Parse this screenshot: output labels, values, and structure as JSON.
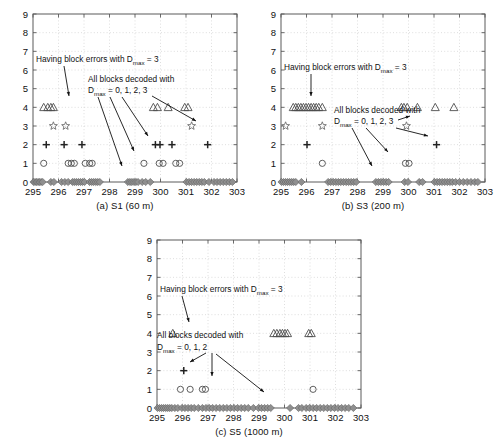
{
  "figure": {
    "axis": {
      "xticks": [
        "295",
        "296",
        "297",
        "298",
        "299",
        "300",
        "301",
        "302",
        "303"
      ],
      "yticks": [
        "0",
        "1",
        "2",
        "3",
        "4",
        "5",
        "6",
        "7",
        "8",
        "9"
      ],
      "xlim": [
        295,
        303
      ],
      "ylim": [
        0,
        9
      ],
      "grid": true
    },
    "annotations": {
      "errors_line": "Having block errors with D",
      "errors_sub": "max",
      "errors_tail": " = 3",
      "decoded_line1": "All blocks decoded with",
      "decoded_line2_pre": "D",
      "decoded_line2_sub": "max",
      "decoded_line2_a": " = 0, 1, 2, 3",
      "decoded_line2_c": " = 0, 1, 2"
    },
    "panels": [
      {
        "id": "a",
        "caption": "(a) S1 (60 m)"
      },
      {
        "id": "b",
        "caption": "(b) S3 (200 m)"
      },
      {
        "id": "c",
        "caption": "(c) S5 (1000 m)"
      }
    ]
  },
  "chart_data": [
    {
      "type": "scatter",
      "title": "(a) S1 (60 m)",
      "xlabel": "",
      "ylabel": "",
      "xlim": [
        295,
        303
      ],
      "ylim": [
        0,
        9
      ],
      "grid": true,
      "legend": "none",
      "series": [
        {
          "name": "Dmax = 3 (triangle)",
          "marker": "triangle",
          "y": 4,
          "x": [
            295.42,
            295.58,
            295.7,
            295.8,
            299.72,
            299.88,
            300.3,
            300.95,
            301.08
          ]
        },
        {
          "name": "Dmax = 3 errors (star)",
          "marker": "star",
          "y": 3,
          "x": [
            295.8,
            296.28,
            301.22
          ]
        },
        {
          "name": "Dmax = 2 (plus)",
          "marker": "plus",
          "y": 2,
          "x": [
            295.52,
            296.22,
            296.92,
            299.8,
            299.98,
            300.45,
            301.85
          ]
        },
        {
          "name": "Dmax = 1 (circle)",
          "marker": "circle",
          "y": 1,
          "x": [
            295.42,
            296.38,
            296.5,
            296.62,
            297.05,
            297.22,
            297.32,
            299.35,
            299.95,
            300.1,
            300.6,
            300.75
          ]
        },
        {
          "name": "Dmax = 0 (diamond)",
          "marker": "diamond",
          "y": 0,
          "x": [
            295.02,
            295.08,
            295.14,
            295.2,
            295.26,
            295.32,
            295.38,
            295.7,
            295.82,
            296.12,
            296.25,
            296.38,
            296.55,
            296.62,
            296.7,
            296.78,
            296.86,
            296.94,
            297.02,
            297.22,
            297.3,
            297.38,
            297.46,
            297.54,
            297.62,
            298.72,
            298.8,
            298.88,
            298.96,
            299.04,
            299.12,
            299.28,
            299.42,
            299.6,
            301.02,
            301.12,
            301.22,
            301.32,
            301.42,
            301.52,
            301.62,
            301.72,
            301.9,
            302.1,
            302.22,
            302.34,
            302.46,
            302.58,
            302.7,
            302.82
          ]
        }
      ]
    },
    {
      "type": "scatter",
      "title": "(b) S3 (200 m)",
      "xlabel": "",
      "ylabel": "",
      "xlim": [
        295,
        303
      ],
      "ylim": [
        0,
        9
      ],
      "grid": true,
      "legend": "none",
      "series": [
        {
          "name": "Dmax = 3 (triangle)",
          "marker": "triangle",
          "y": 4,
          "x": [
            295.48,
            295.58,
            295.68,
            295.78,
            295.88,
            295.98,
            296.08,
            296.18,
            296.28,
            296.38,
            296.48,
            296.62,
            299.72,
            299.82,
            299.95,
            300.35,
            301.05,
            301.78
          ]
        },
        {
          "name": "Dmax = 3 errors (star)",
          "marker": "star",
          "y": 3,
          "x": [
            295.18,
            296.62,
            299.92
          ]
        },
        {
          "name": "Dmax = 2 (plus)",
          "marker": "plus",
          "y": 2,
          "x": [
            296.02,
            301.1
          ]
        },
        {
          "name": "Dmax = 1 (circle)",
          "marker": "circle",
          "y": 1,
          "x": [
            296.62,
            299.88,
            300.02
          ]
        },
        {
          "name": "Dmax = 0 (diamond)",
          "marker": "diamond",
          "y": 0,
          "x": [
            295.02,
            295.1,
            295.18,
            295.26,
            295.34,
            295.42,
            295.5,
            295.58,
            295.8,
            296.85,
            296.95,
            297.05,
            297.15,
            297.25,
            297.35,
            297.45,
            297.55,
            297.65,
            297.75,
            297.85,
            297.95,
            298.72,
            298.82,
            298.92,
            299.02,
            299.12,
            299.22,
            299.85,
            299.98,
            300.42,
            300.55,
            301.02,
            301.12,
            301.22,
            301.32,
            301.42,
            301.52,
            301.62,
            301.72,
            301.85,
            302.0,
            302.15,
            302.3,
            302.45,
            302.6,
            302.72
          ]
        }
      ]
    },
    {
      "type": "scatter",
      "title": "(c) S5 (1000 m)",
      "xlabel": "",
      "ylabel": "",
      "xlim": [
        295,
        303
      ],
      "ylim": [
        0,
        9
      ],
      "grid": true,
      "legend": "none",
      "series": [
        {
          "name": "Dmax = 3 (triangle)",
          "marker": "triangle",
          "y": 4,
          "x": [
            295.62,
            299.58,
            299.7,
            299.82,
            299.92,
            300.02,
            300.12,
            300.95,
            301.05
          ]
        },
        {
          "name": "Dmax = 2 (plus)",
          "marker": "plus",
          "y": 2,
          "x": [
            296.05
          ]
        },
        {
          "name": "Dmax = 1 (circle)",
          "marker": "circle",
          "y": 1,
          "x": [
            295.92,
            296.3,
            296.78,
            296.9,
            301.12
          ]
        },
        {
          "name": "Dmax = 0 (diamond)",
          "marker": "diamond",
          "y": 0,
          "x": [
            295.02,
            295.1,
            295.18,
            295.26,
            295.34,
            295.42,
            295.5,
            295.58,
            295.7,
            295.82,
            295.98,
            296.1,
            296.22,
            296.34,
            296.46,
            296.62,
            296.78,
            296.92,
            297.05,
            297.18,
            297.32,
            297.46,
            297.6,
            297.74,
            297.88,
            298.02,
            298.16,
            298.3,
            298.44,
            298.58,
            298.78,
            298.98,
            299.1,
            299.22,
            299.34,
            299.46,
            300.22,
            300.55,
            300.68,
            300.85,
            300.98,
            301.12,
            301.26,
            301.4,
            301.54,
            301.68,
            301.82,
            301.96,
            302.1,
            302.24,
            302.38,
            302.52,
            302.7
          ]
        }
      ]
    }
  ]
}
